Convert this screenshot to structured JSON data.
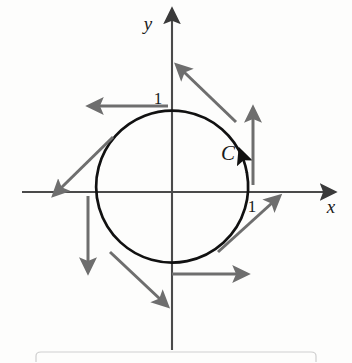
{
  "figure": {
    "background_color": "#fdfdfc",
    "axes": {
      "x_label": "x",
      "y_label": "y",
      "axis_color": "#4a4a4a",
      "origin": {
        "x": 172,
        "y": 192
      }
    },
    "ticks": [
      {
        "name": "tick-y-one",
        "label": "1",
        "x": 156,
        "y": 104
      },
      {
        "name": "tick-x-one",
        "label": "1",
        "x": 252,
        "y": 211
      }
    ],
    "curve": {
      "name": "C",
      "label": "C",
      "label_x": 228,
      "label_y": 160,
      "color": "#111111",
      "stroke_width": 2.6,
      "radius": 76,
      "orientation": "counterclockwise"
    },
    "vectors": {
      "color": "#6e6e6e",
      "stroke_width": 3.0,
      "description": "tangent vectors around the circle",
      "items": [
        {
          "name": "vector-0deg",
          "angle_deg": 0,
          "direction": "up"
        },
        {
          "name": "vector-45deg",
          "angle_deg": 45,
          "direction": "up-left"
        },
        {
          "name": "vector-90deg",
          "angle_deg": 90,
          "direction": "left"
        },
        {
          "name": "vector-135deg",
          "angle_deg": 135,
          "direction": "down-left"
        },
        {
          "name": "vector-180deg",
          "angle_deg": 180,
          "direction": "down"
        },
        {
          "name": "vector-225deg",
          "angle_deg": 225,
          "direction": "down-right"
        },
        {
          "name": "vector-270deg",
          "angle_deg": 270,
          "direction": "right"
        },
        {
          "name": "vector-315deg",
          "angle_deg": 315,
          "direction": "up-right"
        }
      ]
    },
    "footer_box": {
      "name": "caption-box",
      "visible": true,
      "border_color": "#cfcfcf"
    }
  }
}
